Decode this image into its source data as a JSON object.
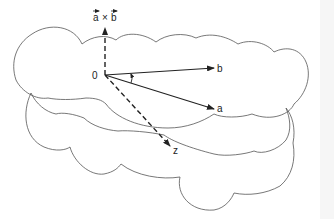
{
  "diagram": {
    "labels": {
      "origin": "0",
      "cross_product": "a × b",
      "cross_a": "a",
      "cross_x": "×",
      "cross_b": "b",
      "vector_a": "a",
      "vector_b": "b",
      "axis_z": "z"
    },
    "colors": {
      "stroke": "#222222",
      "cloud": "#555555",
      "background": "#ffffff"
    },
    "elements": [
      {
        "name": "vector-a",
        "from": [
          105,
          75
        ],
        "to": [
          214,
          109
        ],
        "style": "solid"
      },
      {
        "name": "vector-b",
        "from": [
          105,
          75
        ],
        "to": [
          214,
          68
        ],
        "style": "solid"
      },
      {
        "name": "cross-product-vector",
        "from": [
          105,
          75
        ],
        "to": [
          105,
          27
        ],
        "style": "dashed"
      },
      {
        "name": "z-axis",
        "from": [
          105,
          75
        ],
        "to": [
          170,
          146
        ],
        "style": "dashed"
      },
      {
        "name": "angle-arc",
        "between": [
          "a",
          "b"
        ]
      },
      {
        "name": "upper-cloud",
        "shape": "cloud"
      },
      {
        "name": "lower-cloud",
        "shape": "cloud"
      }
    ]
  }
}
